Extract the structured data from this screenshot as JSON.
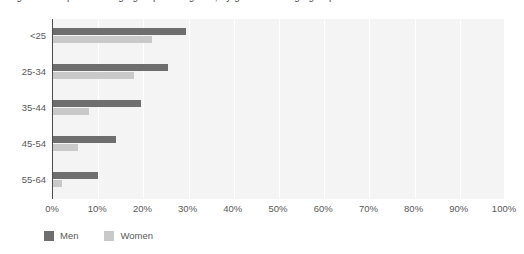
{
  "chart_data": {
    "type": "bar",
    "orientation": "horizontal",
    "title": "Figure 3. Proportion of age group who agreed, by gender and age group",
    "xlabel": "",
    "ylabel": "",
    "categories": [
      "<25",
      "25-34",
      "35-44",
      "45-54",
      "55-64"
    ],
    "series": [
      {
        "name": "Men",
        "color": "#6e6e6e",
        "values": [
          29.5,
          25.5,
          19.5,
          14.0,
          10.0
        ]
      },
      {
        "name": "Women",
        "color": "#c9c9c9",
        "values": [
          22.0,
          18.0,
          8.0,
          5.5,
          2.0
        ]
      }
    ],
    "xlim": [
      0,
      100
    ],
    "xticks": [
      0,
      10,
      20,
      30,
      40,
      50,
      60,
      70,
      80,
      90,
      100
    ],
    "xtick_labels": [
      "0%",
      "10%",
      "20%",
      "30%",
      "40%",
      "50%",
      "60%",
      "70%",
      "80%",
      "90%",
      "100%"
    ],
    "grid": true,
    "grid_axis": "x",
    "legend_position": "bottom-left",
    "plot_background": "#f4f4f4",
    "gridline_color": "#ffffff",
    "axis_color": "#4d4d4d",
    "text_color": "#595959"
  }
}
